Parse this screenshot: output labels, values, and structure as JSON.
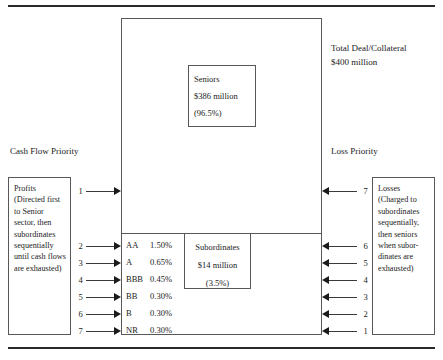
{
  "diagram": {
    "rules": {
      "present": true
    },
    "collateral": {
      "caption_line1": "Total Deal/Collateral",
      "caption_line2": "$400 million"
    },
    "seniors": {
      "label": "Seniors",
      "amount": "$386 million",
      "share": "(96.5%)"
    },
    "subordinates": {
      "label": "Subordinates",
      "amount": "$14 million",
      "share": "(3.5%)"
    },
    "left_heading": "Cash Flow Priority",
    "right_heading": "Loss Priority",
    "profits": {
      "title": "Profits",
      "body": "(Directed first to Senior sector, then subordinates sequentially until cash flows are exhausted)"
    },
    "losses": {
      "title": "Losses",
      "body": "(Charged to subordinates sequentially, then seniors when subor-dinates are exhausted)"
    },
    "tranches": [
      {
        "rating": "AA",
        "spread": "1.50%"
      },
      {
        "rating": "A",
        "spread": "0.65%"
      },
      {
        "rating": "BBB",
        "spread": "0.45%"
      },
      {
        "rating": "BB",
        "spread": "0.30%"
      },
      {
        "rating": "B",
        "spread": "0.30%"
      },
      {
        "rating": "NR",
        "spread": "0.30%"
      }
    ],
    "cash_flow_arrows": [
      {
        "num": "1"
      },
      {
        "num": "2"
      },
      {
        "num": "3"
      },
      {
        "num": "4"
      },
      {
        "num": "5"
      },
      {
        "num": "6"
      },
      {
        "num": "7"
      }
    ],
    "loss_arrows": [
      {
        "num": "7"
      },
      {
        "num": "6"
      },
      {
        "num": "5"
      },
      {
        "num": "4"
      },
      {
        "num": "3"
      },
      {
        "num": "2"
      },
      {
        "num": "1"
      }
    ],
    "colors": {
      "ink": "#1b1b1b",
      "line": "#585858",
      "rule": "#2a2a2a",
      "background": "#ffffff"
    }
  }
}
